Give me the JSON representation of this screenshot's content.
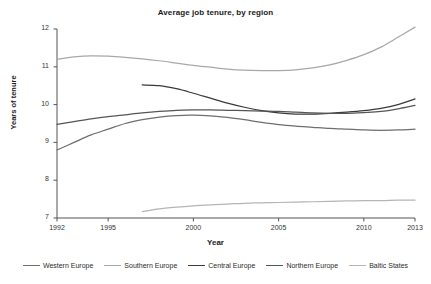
{
  "chart_data": {
    "type": "line",
    "title": "Average job tenure, by region",
    "xlabel": "Year",
    "ylabel": "Years of tenure",
    "xlim": [
      1992,
      2013
    ],
    "ylim": [
      7,
      12
    ],
    "xticks": [
      "1992",
      "1995",
      "2000",
      "2005",
      "2010",
      "2013"
    ],
    "xtick_values": [
      1992,
      1995,
      2000,
      2005,
      2010,
      2013
    ],
    "yticks": [
      "7",
      "8",
      "9",
      "10",
      "11",
      "12"
    ],
    "ytick_values": [
      7,
      8,
      9,
      10,
      11,
      12
    ],
    "grid": false,
    "legend_position": "bottom",
    "series": [
      {
        "name": "Western Europe",
        "color": "#6e6e6e",
        "x": [
          1992,
          1993,
          1994,
          1995,
          1996,
          1997,
          1998,
          1999,
          2000,
          2001,
          2002,
          2003,
          2004,
          2005,
          2006,
          2007,
          2008,
          2009,
          2010,
          2011,
          2012,
          2013
        ],
        "values": [
          8.8,
          9.0,
          9.2,
          9.35,
          9.5,
          9.6,
          9.67,
          9.71,
          9.72,
          9.7,
          9.66,
          9.6,
          9.53,
          9.47,
          9.43,
          9.4,
          9.37,
          9.35,
          9.33,
          9.32,
          9.33,
          9.35
        ]
      },
      {
        "name": "Southern Europe",
        "color": "#a8a8a8",
        "x": [
          1992,
          1993,
          1994,
          1995,
          1996,
          1997,
          1998,
          1999,
          2000,
          2001,
          2002,
          2003,
          2004,
          2005,
          2006,
          2007,
          2008,
          2009,
          2010,
          2011,
          2012,
          2013
        ],
        "values": [
          11.2,
          11.26,
          11.29,
          11.28,
          11.25,
          11.21,
          11.16,
          11.1,
          11.04,
          10.99,
          10.94,
          10.91,
          10.9,
          10.9,
          10.92,
          10.97,
          11.05,
          11.17,
          11.32,
          11.52,
          11.78,
          12.05
        ]
      },
      {
        "name": "Central Europe",
        "color": "#3a3a3a",
        "x": [
          1997,
          1998,
          1999,
          2000,
          2001,
          2002,
          2003,
          2004,
          2005,
          2006,
          2007,
          2008,
          2009,
          2010,
          2011,
          2012,
          2013
        ],
        "values": [
          10.52,
          10.5,
          10.42,
          10.3,
          10.17,
          10.04,
          9.93,
          9.84,
          9.78,
          9.75,
          9.75,
          9.77,
          9.8,
          9.84,
          9.9,
          10.0,
          10.15
        ]
      },
      {
        "name": "Northern Europe",
        "color": "#555555",
        "x": [
          1992,
          1993,
          1994,
          1995,
          1996,
          1997,
          1998,
          1999,
          2000,
          2001,
          2002,
          2003,
          2004,
          2005,
          2006,
          2007,
          2008,
          2009,
          2010,
          2011,
          2012,
          2013
        ],
        "values": [
          9.48,
          9.55,
          9.62,
          9.68,
          9.73,
          9.78,
          9.82,
          9.85,
          9.86,
          9.86,
          9.85,
          9.84,
          9.83,
          9.82,
          9.8,
          9.78,
          9.77,
          9.77,
          9.79,
          9.82,
          9.89,
          9.98
        ]
      },
      {
        "name": "Baltic States",
        "color": "#b5b5b5",
        "x": [
          1997,
          1998,
          1999,
          2000,
          2001,
          2002,
          2003,
          2004,
          2005,
          2006,
          2007,
          2008,
          2009,
          2010,
          2011,
          2012,
          2013
        ],
        "values": [
          7.17,
          7.24,
          7.29,
          7.32,
          7.35,
          7.37,
          7.39,
          7.4,
          7.41,
          7.42,
          7.43,
          7.44,
          7.45,
          7.46,
          7.46,
          7.47,
          7.47
        ]
      }
    ]
  },
  "axes": {
    "spine_color": "#555555"
  },
  "legend": {
    "items": [
      {
        "label": "Western Europe",
        "color": "#6e6e6e"
      },
      {
        "label": "Southern Europe",
        "color": "#a8a8a8"
      },
      {
        "label": "Central Europe",
        "color": "#3a3a3a"
      },
      {
        "label": "Northern Europe",
        "color": "#555555"
      },
      {
        "label": "Baltic States",
        "color": "#b5b5b5"
      }
    ]
  }
}
